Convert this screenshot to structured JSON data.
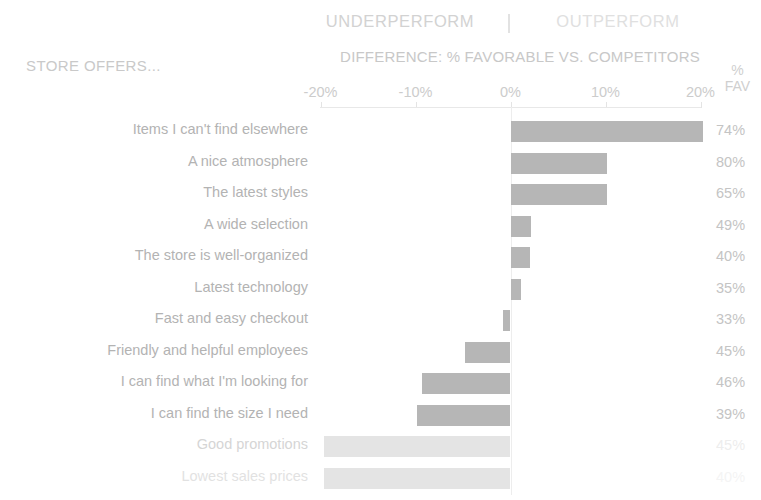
{
  "header": {
    "legend_underperform": "UNDERPERFORM",
    "legend_separator": "|",
    "legend_outperform": "OUTPERFORM",
    "axis_title": "DIFFERENCE: % FAVORABLE VS. COMPETITORS",
    "row_group_label": "STORE OFFERS...",
    "fav_header_line1": "%",
    "fav_header_line2": "FAV"
  },
  "colors": {
    "bar": "#b6b6b6",
    "bar_faded": "#e4e4e4",
    "label_text": "#b3b3b3",
    "header_text": "#c8c8c8",
    "legend_text": "#d2d2d2",
    "axis_line": "#e8e8e8",
    "background": "#ffffff"
  },
  "chart_data": {
    "type": "bar",
    "orientation": "horizontal",
    "title": "DIFFERENCE: % FAVORABLE VS. COMPETITORS",
    "subtitle": "UNDERPERFORM | OUTPERFORM",
    "xlabel": "DIFFERENCE: % FAVORABLE VS. COMPETITORS",
    "ylabel": "STORE OFFERS...",
    "xlim": [
      -20,
      20
    ],
    "xticks": [
      -20,
      -10,
      0,
      10,
      20
    ],
    "xtick_labels": [
      "-20%",
      "-10%",
      "0%",
      "10%",
      "20%"
    ],
    "grid": false,
    "legend_position": "top",
    "value_column_header": "% FAV",
    "categories": [
      "Items I can't find elsewhere",
      "A nice atmosphere",
      "The latest styles",
      "A wide selection",
      "The store is well-organized",
      "Latest technology",
      "Fast and easy checkout",
      "Friendly and helpful employees",
      "I can find what I'm looking for",
      "I can find the size I need",
      "Good promotions",
      "Lowest sales prices"
    ],
    "values": [
      20.3,
      10.2,
      10.2,
      2.2,
      2.0,
      1.1,
      -0.8,
      -4.8,
      -9.3,
      -9.8,
      -19.6,
      -19.6
    ],
    "value_labels": [
      "74%",
      "80%",
      "65%",
      "49%",
      "40%",
      "35%",
      "33%",
      "45%",
      "46%",
      "39%",
      "45%",
      "40%"
    ],
    "faded_rows": [
      10,
      11
    ]
  }
}
